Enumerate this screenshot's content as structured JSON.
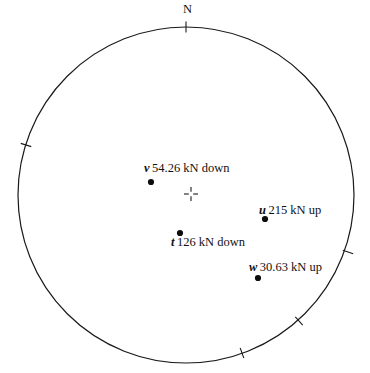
{
  "figure": {
    "type": "stereonet-lower-hemisphere-plot",
    "background_color": "#ffffff",
    "stroke_color": "#1a1a1a",
    "width": 370,
    "height": 373
  },
  "primitive_circle": {
    "center_x": 186,
    "center_y": 195,
    "radius": 168
  },
  "center_marker": {
    "name": "center-cross",
    "x": 191,
    "y": 194,
    "arm": 7
  },
  "direction_labels": [
    {
      "name": "north",
      "text": "N",
      "x": 183,
      "y": 3
    }
  ],
  "azimuth_ticks": [
    {
      "name": "tick-north",
      "angle_deg": 0,
      "x": 186,
      "y": 27
    },
    {
      "name": "tick-upper-left",
      "angle_deg": 287,
      "x": 26,
      "y": 145
    },
    {
      "name": "tick-right",
      "angle_deg": 110,
      "x": 348,
      "y": 252
    },
    {
      "name": "tick-lower-right",
      "angle_deg": 140,
      "x": 299,
      "y": 321
    },
    {
      "name": "tick-bottom",
      "angle_deg": 161,
      "x": 242,
      "y": 353
    }
  ],
  "chart_data": {
    "type": "scatter",
    "title": "",
    "xlabel": "",
    "ylabel": "",
    "projection": "stereographic",
    "grid": false,
    "legend": "none",
    "points": [
      {
        "id": "v",
        "magnitude": "54.26",
        "unit": "kN",
        "sense": "down",
        "value_text": "54.26 kN down",
        "dot_x": 151,
        "dot_y": 182,
        "label_x": 144,
        "label_y": 162
      },
      {
        "id": "u",
        "magnitude": "215",
        "unit": "kN",
        "sense": "up",
        "value_text": "215 kN up",
        "dot_x": 265,
        "dot_y": 219,
        "label_x": 259,
        "label_y": 204
      },
      {
        "id": "t",
        "magnitude": "126",
        "unit": "kN",
        "sense": "down",
        "value_text": "126 kN down",
        "dot_x": 180,
        "dot_y": 233,
        "label_x": 171,
        "label_y": 236
      },
      {
        "id": "w",
        "magnitude": "30.63",
        "unit": "kN",
        "sense": "up",
        "value_text": "30.63 kN up",
        "dot_x": 258,
        "dot_y": 278,
        "label_x": 249,
        "label_y": 261
      }
    ]
  }
}
